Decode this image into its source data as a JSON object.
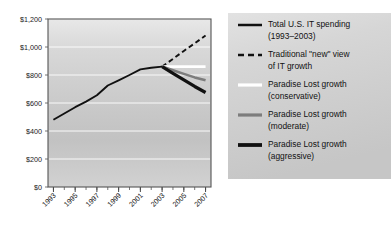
{
  "chart_data": {
    "type": "line",
    "title": "",
    "xlabel": "",
    "ylabel": "",
    "grid": true,
    "legend_position": "right",
    "x": [
      1993,
      1994,
      1995,
      1996,
      1997,
      1998,
      1999,
      2000,
      2001,
      2002,
      2003,
      2004,
      2005,
      2006,
      2007
    ],
    "xlim": [
      1992.5,
      2007.5
    ],
    "ylim": [
      0,
      1200
    ],
    "y_ticks": [
      0,
      200,
      400,
      600,
      800,
      1000,
      1200
    ],
    "y_tick_labels": [
      "$0",
      "$200",
      "$400",
      "$600",
      "$800",
      "$1,000",
      "$1,200"
    ],
    "x_ticks": [
      1993,
      1995,
      1997,
      1999,
      2001,
      2003,
      2005,
      2007
    ],
    "x_tick_labels": [
      "1993",
      "1995",
      "1997",
      "1999",
      "2001",
      "2003",
      "2005",
      "2007"
    ],
    "series": [
      {
        "name": "Total U.S. IT spending (1993–2003)",
        "style": "solid",
        "color": "#111111",
        "width": 1.9,
        "x": [
          1993,
          1994,
          1995,
          1996,
          1997,
          1998,
          1999,
          2000,
          2001,
          2002,
          2003
        ],
        "values": [
          480,
          525,
          570,
          610,
          655,
          725,
          762,
          800,
          840,
          852,
          860
        ]
      },
      {
        "name": "Traditional \"new\" view of IT growth",
        "style": "dashed",
        "color": "#111111",
        "width": 1.9,
        "x": [
          2003,
          2004,
          2005,
          2006,
          2007
        ],
        "values": [
          860,
          915,
          972,
          1026,
          1082
        ]
      },
      {
        "name": "Paradise Lost growth (conservative)",
        "style": "solid",
        "color": "#ffffff",
        "width": 2.6,
        "x": [
          2003,
          2004,
          2005,
          2006,
          2007
        ],
        "values": [
          860,
          860,
          860,
          860,
          860
        ]
      },
      {
        "name": "Paradise Lost growth (moderate)",
        "style": "solid",
        "color": "#7d7d7d",
        "width": 2.6,
        "x": [
          2003,
          2004,
          2005,
          2006,
          2007
        ],
        "values": [
          860,
          834,
          808,
          783,
          762
        ]
      },
      {
        "name": "Paradise Lost growth (aggressive)",
        "style": "solid",
        "color": "#111111",
        "width": 3.2,
        "x": [
          2003,
          2004,
          2005,
          2006,
          2007
        ],
        "values": [
          860,
          812,
          765,
          718,
          675
        ]
      }
    ]
  },
  "legend": {
    "items": [
      {
        "label_line1": "Total U.S. IT spending",
        "label_line2": "(1993–2003)",
        "swatch": "solid-thin-black"
      },
      {
        "label_line1": "Traditional \"new\" view",
        "label_line2": "of IT growth",
        "swatch": "dashed-black"
      },
      {
        "label_line1": "Paradise Lost growth",
        "label_line2": "(conservative)",
        "swatch": "solid-white"
      },
      {
        "label_line1": "Paradise Lost growth",
        "label_line2": "(moderate)",
        "swatch": "solid-gray"
      },
      {
        "label_line1": "Paradise Lost growth",
        "label_line2": "(aggressive)",
        "swatch": "solid-thick-black"
      }
    ]
  },
  "colors": {
    "plot_border": "#4a4a4a",
    "gridline": "#ffffff",
    "historical": "#111111",
    "traditional": "#111111",
    "conservative": "#ffffff",
    "moderate": "#7d7d7d",
    "aggressive": "#111111",
    "text": "#111111"
  }
}
